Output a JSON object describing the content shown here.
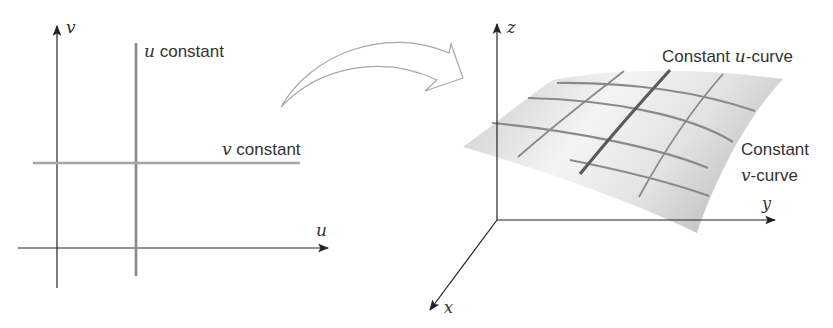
{
  "left_panel": {
    "axis_v_label": "v",
    "axis_u_label": "u",
    "u_constant": {
      "var": "u",
      "text": " constant"
    },
    "v_constant": {
      "var": "v",
      "text": " constant"
    }
  },
  "right_panel": {
    "axis_z_label": "z",
    "axis_y_label": "y",
    "axis_x_label": "x",
    "u_curve_label": {
      "prefix": "Constant ",
      "var": "u",
      "suffix": "-curve"
    },
    "v_curve_label": {
      "line1": "Constant",
      "var": "v",
      "suffix": "-curve"
    }
  },
  "colors": {
    "axis": "#222222",
    "constant_line": "#9a9a9a",
    "highlight_curve": "#555555",
    "grid_curve": "#7a7a7a",
    "surface_light": "#f2f2f2",
    "surface_dark": "#c8c8c8",
    "arrow_outline": "#a0a0a0"
  }
}
